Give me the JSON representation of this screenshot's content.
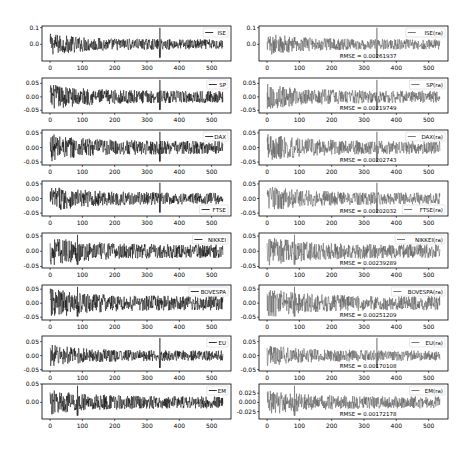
{
  "figure": {
    "columns": [
      "original",
      "reconstructed"
    ],
    "x_ticks": [
      0,
      100,
      200,
      300,
      400,
      500
    ],
    "x_range": [
      -25,
      560
    ]
  },
  "chart_data": [
    {
      "type": "line",
      "panel": "ISE",
      "column": "left",
      "legend": "ISE",
      "yticks": [
        "0.1",
        "0.0"
      ],
      "ytick_values": [
        0.1,
        0.0
      ],
      "ylim": [
        -0.1,
        0.11
      ],
      "n": 536,
      "amplitude": 0.03,
      "spike_at": 340,
      "color": "#000000"
    },
    {
      "type": "line",
      "panel": "ISE(ra)",
      "column": "right",
      "legend": "ISE(ra)",
      "rmse": "RMSE = 0.00261937",
      "yticks": [
        "0.1",
        "0.0"
      ],
      "ytick_values": [
        0.1,
        0.0
      ],
      "ylim": [
        -0.1,
        0.11
      ],
      "n": 536,
      "amplitude": 0.03,
      "spike_at": 340,
      "color": "#555555"
    },
    {
      "type": "line",
      "panel": "SP",
      "column": "left",
      "legend": "SP",
      "yticks": [
        "0.05",
        "0.00",
        "-0.05"
      ],
      "ytick_values": [
        0.05,
        0.0,
        -0.05
      ],
      "ylim": [
        -0.06,
        0.07
      ],
      "n": 536,
      "amplitude": 0.022,
      "spike_at": 340,
      "color": "#000000"
    },
    {
      "type": "line",
      "panel": "SP(ra)",
      "column": "right",
      "legend": "SP(ra)",
      "rmse": "RMSE = 0.00219749",
      "yticks": [
        "0.05",
        "0.00",
        "-0.05"
      ],
      "ytick_values": [
        0.05,
        0.0,
        -0.05
      ],
      "ylim": [
        -0.06,
        0.07
      ],
      "n": 536,
      "amplitude": 0.022,
      "spike_at": 340,
      "color": "#555555"
    },
    {
      "type": "line",
      "panel": "DAX",
      "column": "left",
      "legend": "DAX",
      "yticks": [
        "0.05",
        "0.00",
        "-0.05"
      ],
      "ytick_values": [
        0.05,
        0.0,
        -0.05
      ],
      "ylim": [
        -0.06,
        0.06
      ],
      "n": 536,
      "amplitude": 0.022,
      "spike_at": 340,
      "color": "#000000"
    },
    {
      "type": "line",
      "panel": "DAX(ra)",
      "column": "right",
      "legend": "DAX(ra)",
      "rmse": "RMSE = 0.00202743",
      "yticks": [
        "0.05",
        "0.00",
        "-0.05"
      ],
      "ytick_values": [
        0.05,
        0.0,
        -0.05
      ],
      "ylim": [
        -0.06,
        0.06
      ],
      "n": 536,
      "amplitude": 0.022,
      "spike_at": 340,
      "color": "#555555"
    },
    {
      "type": "line",
      "panel": "FTSE",
      "column": "left",
      "legend": "FTSE",
      "legend_pos": "lower right",
      "yticks": [
        "0.05",
        "0.00",
        "-0.05"
      ],
      "ytick_values": [
        0.05,
        0.0,
        -0.05
      ],
      "ylim": [
        -0.06,
        0.06
      ],
      "n": 536,
      "amplitude": 0.02,
      "spike_at": 340,
      "color": "#000000"
    },
    {
      "type": "line",
      "panel": "FTSE(ra)",
      "column": "right",
      "legend": "FTSE(ra)",
      "legend_pos": "lower right",
      "rmse": "RMSE = 0.00202032",
      "yticks": [
        "0.05",
        "0.00",
        "-0.05"
      ],
      "ytick_values": [
        0.05,
        0.0,
        -0.05
      ],
      "ylim": [
        -0.06,
        0.06
      ],
      "n": 536,
      "amplitude": 0.02,
      "spike_at": 340,
      "color": "#555555"
    },
    {
      "type": "line",
      "panel": "NIKKEI",
      "column": "left",
      "legend": "NIKKEI",
      "yticks": [
        "0.05",
        "0.00",
        "-0.05"
      ],
      "ytick_values": [
        0.05,
        0.0,
        -0.05
      ],
      "ylim": [
        -0.055,
        0.06
      ],
      "n": 536,
      "amplitude": 0.022,
      "spike_at": 85,
      "color": "#000000"
    },
    {
      "type": "line",
      "panel": "NIKKEI(ra)",
      "column": "right",
      "legend": "NIKKEI(ra)",
      "rmse": "RMSE = 0.00239289",
      "yticks": [
        "0.05",
        "0.00",
        "-0.05"
      ],
      "ytick_values": [
        0.05,
        0.0,
        -0.05
      ],
      "ylim": [
        -0.055,
        0.06
      ],
      "n": 536,
      "amplitude": 0.022,
      "spike_at": 85,
      "color": "#555555"
    },
    {
      "type": "line",
      "panel": "BOVESPA",
      "column": "left",
      "legend": "BOVESPA",
      "yticks": [
        "0.05",
        "0.00",
        "-0.05"
      ],
      "ytick_values": [
        0.05,
        0.0,
        -0.05
      ],
      "ylim": [
        -0.06,
        0.065
      ],
      "n": 536,
      "amplitude": 0.025,
      "spike_at": 85,
      "color": "#000000"
    },
    {
      "type": "line",
      "panel": "BOVESPA(ra)",
      "column": "right",
      "legend": "BOVESPA(ra)",
      "rmse": "RMSE = 0.00251209",
      "yticks": [
        "0.05",
        "0.00",
        "-0.05"
      ],
      "ytick_values": [
        0.05,
        0.0,
        -0.05
      ],
      "ylim": [
        -0.06,
        0.065
      ],
      "n": 536,
      "amplitude": 0.025,
      "spike_at": 85,
      "color": "#555555"
    },
    {
      "type": "line",
      "panel": "EU",
      "column": "left",
      "legend": "EU",
      "yticks": [
        "0.05",
        "0.00",
        "-0.05"
      ],
      "ytick_values": [
        0.05,
        0.0,
        -0.05
      ],
      "ylim": [
        -0.055,
        0.07
      ],
      "n": 536,
      "amplitude": 0.018,
      "spike_at": 340,
      "color": "#000000"
    },
    {
      "type": "line",
      "panel": "EU(ra)",
      "column": "right",
      "legend": "EU(ra)",
      "rmse": "RMSE = 0.00170108",
      "yticks": [
        "0.05",
        "0.00",
        "-0.05"
      ],
      "ytick_values": [
        0.05,
        0.0,
        -0.05
      ],
      "ylim": [
        -0.055,
        0.07
      ],
      "n": 536,
      "amplitude": 0.018,
      "spike_at": 340,
      "color": "#555555"
    },
    {
      "type": "line",
      "panel": "EM",
      "column": "left",
      "legend": "EM",
      "yticks": [
        "0.05",
        "0.00"
      ],
      "ytick_values": [
        0.05,
        0.0
      ],
      "ylim": [
        -0.045,
        0.05
      ],
      "n": 536,
      "amplitude": 0.016,
      "spike_at": 85,
      "color": "#000000"
    },
    {
      "type": "line",
      "panel": "EM(ra)",
      "column": "right",
      "legend": "EM(ra)",
      "rmse": "RMSE = 0.00172178",
      "yticks": [
        "0.025",
        "0.000",
        "-0.025"
      ],
      "ytick_values": [
        0.025,
        0.0,
        -0.025
      ],
      "ylim": [
        -0.045,
        0.05
      ],
      "n": 536,
      "amplitude": 0.016,
      "spike_at": 85,
      "color": "#555555"
    }
  ]
}
